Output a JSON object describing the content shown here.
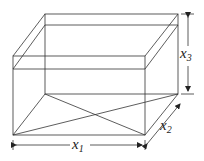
{
  "diagram": {
    "type": "box-3d",
    "labels": {
      "x1": {
        "base": "x",
        "sub": "1"
      },
      "x2": {
        "base": "x",
        "sub": "2"
      },
      "x3": {
        "base": "x",
        "sub": "3"
      }
    },
    "colors": {
      "stroke": "#333333",
      "background": "#ffffff"
    }
  }
}
